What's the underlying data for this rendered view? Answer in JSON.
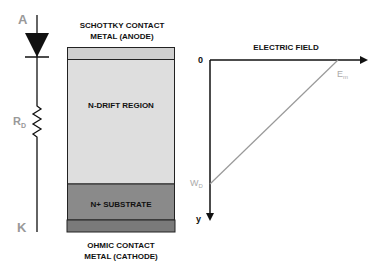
{
  "diagram": {
    "circuit": {
      "anode_label": "A",
      "cathode_label": "K",
      "resistor_label": "R",
      "resistor_subscript": "D"
    },
    "device": {
      "top_contact_line1": "SCHOTTKY CONTACT",
      "top_contact_line2": "METAL (ANODE)",
      "drift_region": "N-DRIFT REGION",
      "substrate": "N+ SUBSTRATE",
      "bottom_contact_line1": "OHMIC CONTACT",
      "bottom_contact_line2": "METAL (CATHODE)"
    },
    "field_plot": {
      "title": "ELECTRIC FIELD",
      "origin_label": "0",
      "y_axis_label": "y",
      "peak_label": "E",
      "peak_subscript": "m",
      "depletion_label": "W",
      "depletion_subscript": "D"
    },
    "colors": {
      "metal": "#cfcfcf",
      "drift": "#dedede",
      "substrate": "#8a8a8a",
      "bottom_metal": "#7a7a7a",
      "field_line": "#999999"
    }
  }
}
